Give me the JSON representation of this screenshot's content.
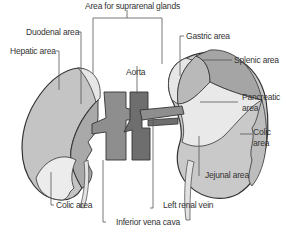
{
  "diagram": {
    "labels": {
      "suprarenal": "Area for suprarenal glands",
      "duodenal": "Duodenal area",
      "hepatic": "Hepatic area",
      "aorta": "Aorta",
      "gastric": "Gastric area",
      "splenic": "Splenic area",
      "pancreatic_1": "Pancreatic",
      "pancreatic_2": "area",
      "colic_right": "Colic area",
      "colic_left_1": "Colic",
      "colic_left_2": "area",
      "jejunal": "Jejunal area",
      "left_renal_vein": "Left renal vein",
      "ivc": "Inferior vena cava"
    },
    "colors": {
      "hepatic": "#c4c4c4",
      "duodenal": "#a9a9a9",
      "suprarenal": "#e6e6e6",
      "colic": "#ececec",
      "gastric": "#b9b9b9",
      "splenic": "#a5a5a5",
      "pancreatic": "#e9e9e9",
      "jejunal": "#c9c9c9",
      "ivc": "#8e8e8e",
      "aorta": "#6e6e6e",
      "outline": "#333333",
      "leader": "#555555"
    }
  }
}
